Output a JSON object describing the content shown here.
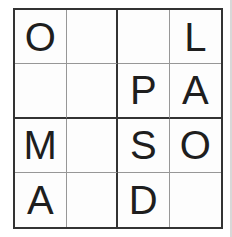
{
  "puzzle": {
    "type": "letter-grid-puzzle",
    "grid_size": 4,
    "letters_used": [
      "O",
      "L",
      "P",
      "A",
      "M",
      "S",
      "D"
    ],
    "rows": [
      [
        "O",
        "",
        "",
        "L"
      ],
      [
        "",
        "",
        "P",
        "A"
      ],
      [
        "M",
        "",
        "S",
        "O"
      ],
      [
        "A",
        "",
        "D",
        ""
      ]
    ]
  },
  "colors": {
    "background": "#ffffff",
    "grid_background": "#fdfdfd",
    "thick_line": "#333333",
    "thin_line": "#979797",
    "letter": "#1e1e1e",
    "page_edge": "#d8d8d8"
  }
}
